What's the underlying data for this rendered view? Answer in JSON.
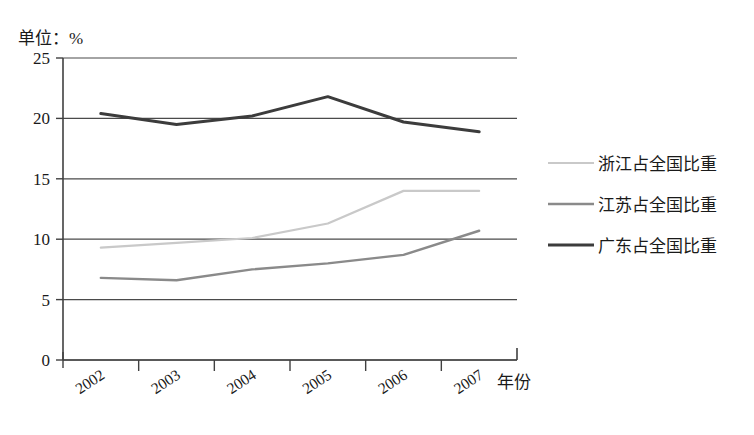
{
  "chart_data": {
    "type": "line",
    "title": "单位：%",
    "xlabel": "年份",
    "ylabel": "",
    "categories": [
      "2002",
      "2003",
      "2004",
      "2005",
      "2006",
      "2007"
    ],
    "ylim": [
      0,
      25
    ],
    "yticks": [
      "0",
      "5",
      "10",
      "15",
      "20",
      "25"
    ],
    "grid": true,
    "legend_position": "right",
    "series": [
      {
        "name": "浙江占全国比重",
        "color": "#c9c9c9",
        "values": [
          9.3,
          9.7,
          10.1,
          11.3,
          14.0,
          14.0
        ]
      },
      {
        "name": "江苏占全国比重",
        "color": "#8a8a8a",
        "values": [
          6.8,
          6.6,
          7.5,
          8.0,
          8.7,
          10.7
        ]
      },
      {
        "name": "广东占全国比重",
        "color": "#3c3c3c",
        "values": [
          20.4,
          19.5,
          20.2,
          21.8,
          19.7,
          18.9
        ]
      }
    ]
  },
  "axis": {
    "line_color": "#404040",
    "grid_color": "#4a4a4a"
  }
}
